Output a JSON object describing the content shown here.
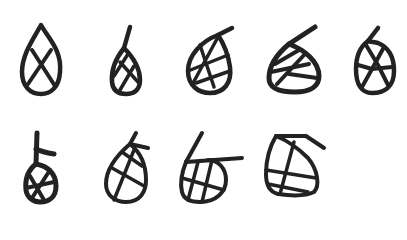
{
  "figure": {
    "background": "#ffffff",
    "ink_color": "#222222",
    "rows": [
      {
        "glyphs": [
          {
            "name": "glyph-1",
            "shape": "teardrop with crossed lattice"
          },
          {
            "name": "glyph-2",
            "shape": "narrow teardrop with tail and crossed lattice"
          },
          {
            "name": "glyph-3",
            "shape": "round teardrop with tail and grid lattice"
          },
          {
            "name": "glyph-4",
            "shape": "wide teardrop with tail and hatched lattice"
          },
          {
            "name": "glyph-5",
            "shape": "oval with hook and cellular lattice"
          }
        ]
      },
      {
        "glyphs": [
          {
            "name": "glyph-6",
            "shape": "small teardrop with cross-topped stem and grid"
          },
          {
            "name": "glyph-7",
            "shape": "teardrop with hooked tail and grid lattice"
          },
          {
            "name": "glyph-8",
            "shape": "teardrop with crossbar tail and grid lattice"
          },
          {
            "name": "glyph-9",
            "shape": "squared teardrop with flag top and grid lattice"
          }
        ]
      }
    ]
  }
}
